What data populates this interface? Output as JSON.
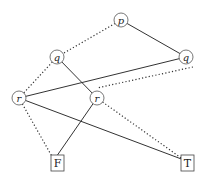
{
  "diagram": {
    "type": "binary-decision-diagram",
    "nodes": [
      {
        "id": "p",
        "label": "p",
        "kind": "variable",
        "x": 121,
        "y": 20
      },
      {
        "id": "q1",
        "label": "q",
        "kind": "variable",
        "x": 57,
        "y": 57
      },
      {
        "id": "q2",
        "label": "q",
        "kind": "variable",
        "x": 186,
        "y": 57
      },
      {
        "id": "r1",
        "label": "r",
        "kind": "variable",
        "x": 19,
        "y": 98
      },
      {
        "id": "r2",
        "label": "r",
        "kind": "variable",
        "x": 97,
        "y": 98
      },
      {
        "id": "F",
        "label": "F",
        "kind": "terminal",
        "x": 57,
        "y": 163
      },
      {
        "id": "T",
        "label": "T",
        "kind": "terminal",
        "x": 187,
        "y": 163
      }
    ],
    "edges": [
      {
        "from": "p",
        "to": "q1",
        "style": "dotted"
      },
      {
        "from": "p",
        "to": "q2",
        "style": "solid"
      },
      {
        "from": "q1",
        "to": "r1",
        "style": "dotted"
      },
      {
        "from": "q1",
        "to": "r2",
        "style": "solid"
      },
      {
        "from": "q2",
        "to": "r1",
        "style": "solid"
      },
      {
        "from": "q2",
        "to": "r2",
        "style": "dotted"
      },
      {
        "from": "r1",
        "to": "F",
        "style": "dotted"
      },
      {
        "from": "r1",
        "to": "T",
        "style": "solid"
      },
      {
        "from": "r2",
        "to": "F",
        "style": "solid"
      },
      {
        "from": "r2",
        "to": "T",
        "style": "dotted"
      }
    ],
    "legend": {
      "dotted": "low (false) branch",
      "solid": "high (true) branch"
    }
  }
}
